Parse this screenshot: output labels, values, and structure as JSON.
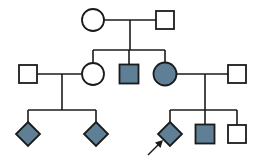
{
  "diagram": {
    "type": "pedigree",
    "legend": {
      "affected_fill": "#5f7f96",
      "unaffected_fill": "#ffffff",
      "line_color": "#1b1b1b",
      "background": "#ffffff"
    },
    "symbol_meanings": {
      "square": "male",
      "circle": "female",
      "diamond": "sex unspecified",
      "filled": "affected",
      "open": "unaffected",
      "arrow": "proband"
    },
    "generations": [
      {
        "id": "I",
        "label": "I",
        "individuals": [
          {
            "id": "I-1",
            "name": "generation-1-female-unaffected",
            "shape": "circle",
            "status": "unaffected",
            "cx": 93,
            "cy": 20,
            "r": 11
          },
          {
            "id": "I-2",
            "name": "generation-1-male-unaffected",
            "shape": "square",
            "status": "unaffected",
            "cx": 165,
            "cy": 20,
            "size": 18
          }
        ]
      },
      {
        "id": "II",
        "label": "II",
        "individuals": [
          {
            "id": "II-1",
            "name": "generation-2-male-spouse-left-unaffected",
            "shape": "square",
            "status": "unaffected",
            "cx": 28,
            "cy": 74,
            "size": 18
          },
          {
            "id": "II-2",
            "name": "generation-2-female-unaffected",
            "shape": "circle",
            "status": "unaffected",
            "cx": 93,
            "cy": 74,
            "r": 11
          },
          {
            "id": "II-3",
            "name": "generation-2-male-affected",
            "shape": "square",
            "status": "affected",
            "cx": 129,
            "cy": 74,
            "size": 19
          },
          {
            "id": "II-4",
            "name": "generation-2-female-affected",
            "shape": "circle",
            "status": "affected",
            "cx": 165,
            "cy": 74,
            "r": 11.5
          },
          {
            "id": "II-5",
            "name": "generation-2-male-spouse-right-unaffected",
            "shape": "square",
            "status": "unaffected",
            "cx": 237,
            "cy": 74,
            "size": 18
          }
        ]
      },
      {
        "id": "III",
        "label": "III",
        "individuals": [
          {
            "id": "III-1",
            "name": "generation-3-diamond-affected-left-1",
            "shape": "diamond",
            "status": "affected",
            "cx": 28,
            "cy": 134,
            "size": 24
          },
          {
            "id": "III-2",
            "name": "generation-3-diamond-affected-left-2",
            "shape": "diamond",
            "status": "affected",
            "cx": 96,
            "cy": 134,
            "size": 24
          },
          {
            "id": "III-3",
            "name": "generation-3-diamond-affected-proband",
            "shape": "diamond",
            "status": "affected",
            "cx": 170,
            "cy": 134,
            "size": 24,
            "proband": true
          },
          {
            "id": "III-4",
            "name": "generation-3-male-affected",
            "shape": "square",
            "status": "affected",
            "cx": 205,
            "cy": 134,
            "size": 19
          },
          {
            "id": "III-5",
            "name": "generation-3-male-unaffected",
            "shape": "square",
            "status": "unaffected",
            "cx": 237,
            "cy": 134,
            "size": 18
          }
        ]
      }
    ],
    "matings": [
      {
        "id": "M1",
        "name": "mating-line-generation-1",
        "partners": [
          "I-1",
          "I-2"
        ],
        "x1": 104,
        "x2": 156,
        "y": 20,
        "drop_x": 130,
        "drop_y2": 50
      },
      {
        "id": "M2",
        "name": "mating-line-generation-2-left",
        "partners": [
          "II-1",
          "II-2"
        ],
        "x1": 37,
        "x2": 82,
        "y": 74,
        "drop_x": 62,
        "drop_y2": 110
      },
      {
        "id": "M3",
        "name": "mating-line-generation-2-right",
        "partners": [
          "II-4",
          "II-5"
        ],
        "x1": 177,
        "x2": 228,
        "y": 74,
        "drop_x": 205,
        "drop_y2": 110
      }
    ],
    "sibships": [
      {
        "id": "S1",
        "name": "sibship-line-generation-2",
        "y": 50,
        "x1": 93,
        "x2": 165,
        "children_x": [
          93,
          129,
          165
        ],
        "child_top_y": 63
      },
      {
        "id": "S2",
        "name": "sibship-line-generation-3-left",
        "y": 110,
        "x1": 28,
        "x2": 96,
        "children_x": [
          28,
          96
        ],
        "child_top_y": 122
      },
      {
        "id": "S3",
        "name": "sibship-line-generation-3-right",
        "y": 110,
        "x1": 170,
        "x2": 237,
        "children_x": [
          170,
          205,
          237
        ],
        "child_top_y": 122
      }
    ],
    "proband": {
      "name": "proband-arrow",
      "target": "III-3",
      "tail_x": 148,
      "tail_y": 155,
      "head_x": 161,
      "head_y": 142
    }
  }
}
